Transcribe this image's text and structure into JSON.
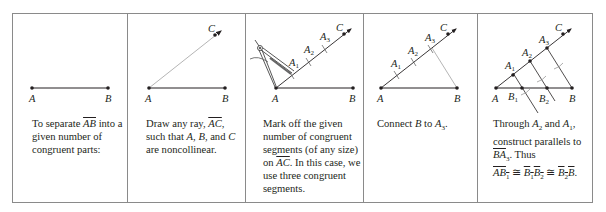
{
  "figure": {
    "panel_count": 5
  },
  "panels": [
    {
      "step": 1,
      "caption": {
        "before": "To separate ",
        "segment": "AB",
        "after": " into a given number of congruent parts:"
      },
      "points": {
        "A": "A",
        "B": "B"
      }
    },
    {
      "step": 2,
      "caption": {
        "before": "Draw any ray, ",
        "ray": "AC",
        "after_ray": ", such that ",
        "p1": "A",
        "sep1": ", ",
        "p2": "B",
        "sep2": ", and ",
        "p3": "C",
        "after": " are noncollinear."
      },
      "points": {
        "A": "A",
        "B": "B",
        "C": "C"
      }
    },
    {
      "step": 3,
      "caption": {
        "before": "Mark off the given number of congruent segments (of any size) on ",
        "ray": "AC",
        "after": ". In this case, we use three congruent segments."
      },
      "points": {
        "A": "A",
        "B": "B",
        "C": "C",
        "A1": "A",
        "A2": "A",
        "A3": "A"
      },
      "subscripts": [
        "1",
        "2",
        "3"
      ],
      "tool": "compass"
    },
    {
      "step": 4,
      "caption": {
        "before": "Connect ",
        "p1": "B",
        "mid": " to ",
        "p2": "A",
        "p2_sub": "3",
        "after": "."
      },
      "points": {
        "A": "A",
        "B": "B",
        "C": "C"
      },
      "subscripts": [
        "1",
        "2",
        "3"
      ]
    },
    {
      "step": 5,
      "caption": {
        "before": "Through ",
        "p1": "A",
        "p1_sub": "2",
        "mid": " and ",
        "p2": "A",
        "p2_sub": "1",
        "after1": ", construct parallels to ",
        "seg": "BA",
        "seg_sub": "3",
        "after2": ". Thus",
        "eq": {
          "s1": "AB",
          "s1_sub": "1",
          "cong": " ≅ ",
          "s2a": "B",
          "s2a_sub": "1",
          "s2b": "B",
          "s2b_sub": "2",
          "s3a": "B",
          "s3a_sub": "2",
          "s3b": "B",
          "end": "."
        }
      },
      "points": {
        "A": "A",
        "B": "B",
        "C": "C"
      },
      "subscripts": [
        "1",
        "2",
        "3"
      ]
    }
  ],
  "colors": {
    "line": "#231f20",
    "light_line": "#bdbdbd",
    "border": "#8a8a8a"
  }
}
